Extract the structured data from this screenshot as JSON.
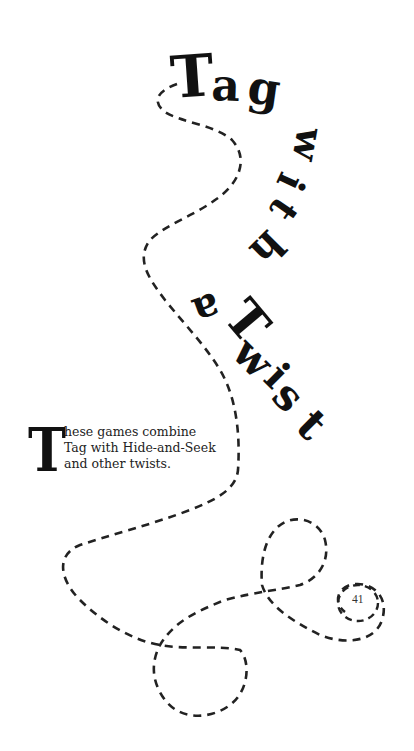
{
  "title": {
    "full": "Tag with a Twist",
    "words": [
      "Tag",
      "with",
      "a",
      "Twist"
    ],
    "letters": {
      "T1": "T",
      "a1": "a",
      "g": "g",
      "w": "w",
      "i": "i",
      "t": "t",
      "h": "h",
      "a2": "a",
      "T2": "T",
      "w2": "w",
      "i2": "i",
      "s": "s",
      "t2": "t"
    }
  },
  "intro": {
    "drop_cap": "T",
    "lines": [
      "hese games combine",
      "Tag with Hide-and-Seek",
      "and other twists."
    ]
  },
  "page_number": "41",
  "colors": {
    "ink": "#111111",
    "background": "#ffffff",
    "dash": "#222222"
  }
}
